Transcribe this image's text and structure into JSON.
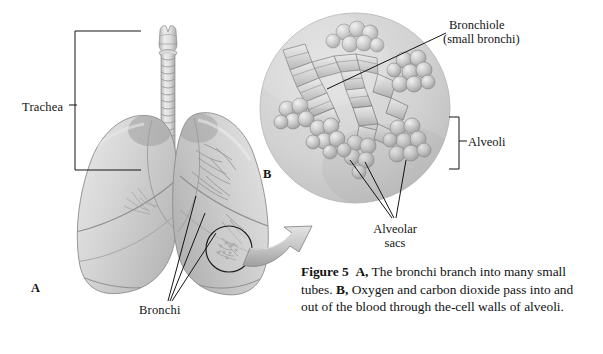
{
  "figure": {
    "background_color": "#ffffff",
    "ink_color": "#141414",
    "tissue_color": "#c9c9c9"
  },
  "panels": {
    "a_label": "A",
    "b_label": "B"
  },
  "labels": {
    "trachea": "Trachea",
    "bronchi": "Bronchi",
    "bronchiole_line1": "Bronchiole",
    "bronchiole_line2": "(small bronchi)",
    "alveoli": "Alveoli",
    "alveolar_sacs_line1": "Alveolar",
    "alveolar_sacs_line2": "sacs"
  },
  "caption": {
    "figure_number": "Figure 5",
    "marker_a": "A,",
    "text_a": "The bronchi branch into many small tubes.",
    "marker_b": "B,",
    "text_b": "Oxygen and carbon dioxide pass into and out of the blood through the-cell walls of alveoli."
  },
  "icons": {
    "magnify_arrow": "curved-arrow-icon",
    "detail_circle": "magnifier-circle-icon",
    "trachea_bracket": "bracket-left-icon",
    "alveoli_bracket": "bracket-right-icon"
  }
}
